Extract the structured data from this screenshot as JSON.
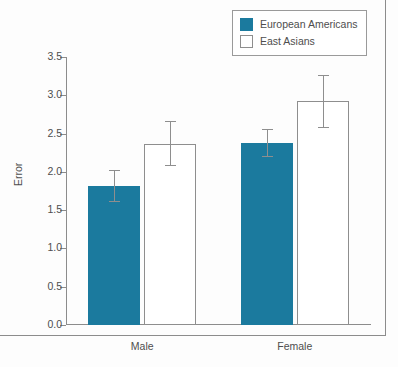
{
  "chart_data": {
    "type": "bar",
    "title": "",
    "xlabel": "",
    "ylabel": "Error",
    "ylim": [
      0.0,
      3.5
    ],
    "yticks": [
      "0.0",
      "0.5",
      "1.0",
      "1.5",
      "2.0",
      "2.5",
      "3.0",
      "3.5"
    ],
    "ytick_values": [
      0.0,
      0.5,
      1.0,
      1.5,
      2.0,
      2.5,
      3.0,
      3.5
    ],
    "grid": false,
    "legend_position": "top-right",
    "categories": [
      "Male",
      "Female"
    ],
    "series": [
      {
        "name": "European Americans",
        "color": "#1b7a9e",
        "fill": "solid",
        "values": [
          1.82,
          2.38
        ],
        "errors": [
          0.21,
          0.18
        ]
      },
      {
        "name": "East Asians",
        "color": "#ffffff",
        "fill": "hollow",
        "values": [
          2.37,
          2.92
        ],
        "errors": [
          0.3,
          0.35
        ]
      }
    ]
  },
  "legend": {
    "entries": [
      {
        "label": "European Americans",
        "swatch": "filled-square-icon"
      },
      {
        "label": "East Asians",
        "swatch": "hollow-square-icon"
      }
    ]
  },
  "axes": {
    "y_title": "Error",
    "y_tick_labels": [
      "3.5",
      "3.0",
      "2.5",
      "2.0",
      "1.5",
      "1.0",
      "0.5",
      "0.0"
    ],
    "x_tick_labels": [
      "Male",
      "Female"
    ]
  },
  "colors": {
    "series_fill": "#1b7a9e",
    "series_hollow_border": "#8e8e8e",
    "axis": "#8c8c8c",
    "text": "#4e4e4e",
    "background": "#fdfdfd"
  }
}
